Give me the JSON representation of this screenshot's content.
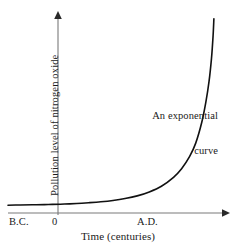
{
  "figure": {
    "background_color": "#ffffff",
    "axis_color": "#7a7a7a",
    "curve_color": "#111111",
    "text_color": "#1a1a1a"
  },
  "annotation": {
    "line1": "An exponential",
    "line2": "curve"
  },
  "chart_data": {
    "type": "line",
    "title": "",
    "subtitle": "",
    "xlabel": "Time (centuries)",
    "ylabel": "Pollution level of nitrogen oxide",
    "grid": false,
    "legend": null,
    "axes": {
      "x_tick_labels": [
        "B.C.",
        "0",
        "A.D."
      ],
      "y_tick_labels": [],
      "x_arrow": true,
      "y_arrow": true,
      "xlim": [
        -1.1,
        4.3
      ],
      "ylim": [
        0,
        10.2
      ]
    },
    "annotations": [
      {
        "text": "An exponential curve",
        "x": 3.2,
        "y": 6.2,
        "align": "right"
      }
    ],
    "series": [
      {
        "name": "An exponential curve",
        "description": "Pollution level of nitrogen oxide rising exponentially over time",
        "x": [
          -1.1,
          -0.8,
          -0.5,
          -0.2,
          0.0,
          0.3,
          0.6,
          0.9,
          1.2,
          1.5,
          1.8,
          2.1,
          2.4,
          2.7,
          3.0,
          3.2,
          3.4,
          3.55,
          3.7,
          3.8,
          3.88,
          3.94,
          3.98,
          4.0
        ],
        "y": [
          0.18,
          0.19,
          0.2,
          0.21,
          0.22,
          0.24,
          0.27,
          0.31,
          0.36,
          0.43,
          0.53,
          0.67,
          0.88,
          1.18,
          1.65,
          2.1,
          2.75,
          3.45,
          4.55,
          5.6,
          6.7,
          7.9,
          9.1,
          10.0
        ]
      }
    ]
  }
}
